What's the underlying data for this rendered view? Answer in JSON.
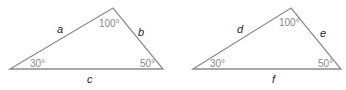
{
  "diagram": {
    "colors": {
      "stroke": "#8c8c8c",
      "side_label": "#231f20",
      "angle_label": "#8a8a8a"
    },
    "triangles": [
      {
        "vertices": {
          "left": [
            10,
            69
          ],
          "top": [
            113,
            8
          ],
          "right": [
            163,
            69
          ]
        },
        "angles": {
          "left": "30°",
          "top": "100°",
          "right": "50°"
        },
        "sides": {
          "left_top": "a",
          "top_right": "b",
          "bottom": "c"
        }
      },
      {
        "vertices": {
          "left": [
            193,
            69
          ],
          "top": [
            291,
            8
          ],
          "right": [
            341,
            69
          ]
        },
        "angles": {
          "left": "30°",
          "top": "100°",
          "right": "50°"
        },
        "sides": {
          "left_top": "d",
          "top_right": "e",
          "bottom": "f"
        }
      }
    ]
  }
}
